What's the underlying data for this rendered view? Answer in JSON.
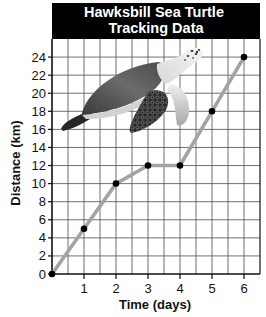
{
  "chart_data": {
    "type": "line",
    "title": "Hawksbill Sea Turtle Tracking Data",
    "title_lines": [
      "Hawksbill Sea Turtle",
      "Tracking Data"
    ],
    "xlabel": "Time (days)",
    "ylabel": "Distance (km)",
    "x": [
      0,
      1,
      2,
      3,
      4,
      5,
      6
    ],
    "series": [
      {
        "name": "Distance (km)",
        "values": [
          0,
          5,
          10,
          12,
          12,
          18,
          24
        ]
      }
    ],
    "x_ticks": [
      1,
      2,
      3,
      4,
      5,
      6
    ],
    "y_ticks": [
      0,
      2,
      4,
      6,
      8,
      10,
      12,
      14,
      16,
      18,
      20,
      22,
      24
    ],
    "xlim": [
      0,
      6.5
    ],
    "ylim": [
      0,
      26
    ],
    "grid": true,
    "x_grid_step": 0.5,
    "y_grid_step": 2,
    "legend": null,
    "markers": true,
    "colors": {
      "line": "#a3a3a3",
      "marker": "#000000",
      "axis": "#111111",
      "grid": "#4d4d4d",
      "title_bg": "#000000",
      "title_text": "#ffffff"
    }
  },
  "illustration": {
    "subject": "hawksbill sea turtle",
    "style": "grayscale photo"
  }
}
